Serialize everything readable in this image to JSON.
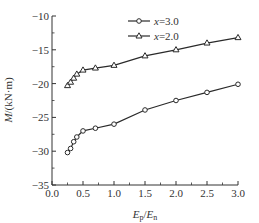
{
  "chart_data": {
    "type": "line",
    "title": "",
    "xlabel": "Ep/En",
    "ylabel": "M/(kN·m)",
    "xlim": [
      0.0,
      3.0
    ],
    "ylim": [
      -35,
      -10
    ],
    "grid": false,
    "legend_position": "upper center",
    "x_ticks": [
      "0.0",
      "0.5",
      "1.0",
      "1.5",
      "2.0",
      "2.5",
      "3.0"
    ],
    "y_ticks": [
      "-10",
      "-15",
      "-20",
      "-25",
      "-30",
      "-35"
    ],
    "x": [
      0.25,
      0.3,
      0.35,
      0.4,
      0.5,
      0.7,
      1.0,
      1.5,
      2.0,
      2.5,
      3.0
    ],
    "series": [
      {
        "name": "x=3.0",
        "marker": "circle",
        "values": [
          -30.2,
          -29.6,
          -28.6,
          -27.9,
          -27.0,
          -26.6,
          -26.0,
          -23.9,
          -22.5,
          -21.3,
          -20.1
        ]
      },
      {
        "name": "x=2.0",
        "marker": "triangle",
        "values": [
          -20.3,
          -19.8,
          -19.2,
          -18.6,
          -18.0,
          -17.7,
          -17.3,
          -15.9,
          -15.0,
          -14.0,
          -13.2
        ]
      }
    ]
  },
  "axes": {
    "xlabel_main": "E",
    "xlabel_sub1": "p",
    "xlabel_sep": "/",
    "xlabel_main2": "E",
    "xlabel_sub2": "n",
    "ylabel_italic": "M",
    "ylabel_unit": "/(kN·m)"
  },
  "legend": {
    "items": [
      {
        "var": "x",
        "text": "=3.0"
      },
      {
        "var": "x",
        "text": "=2.0"
      }
    ]
  },
  "colors": {
    "line": "#2a2a2a",
    "axis": "#333333",
    "marker_fill": "#ffffff"
  }
}
